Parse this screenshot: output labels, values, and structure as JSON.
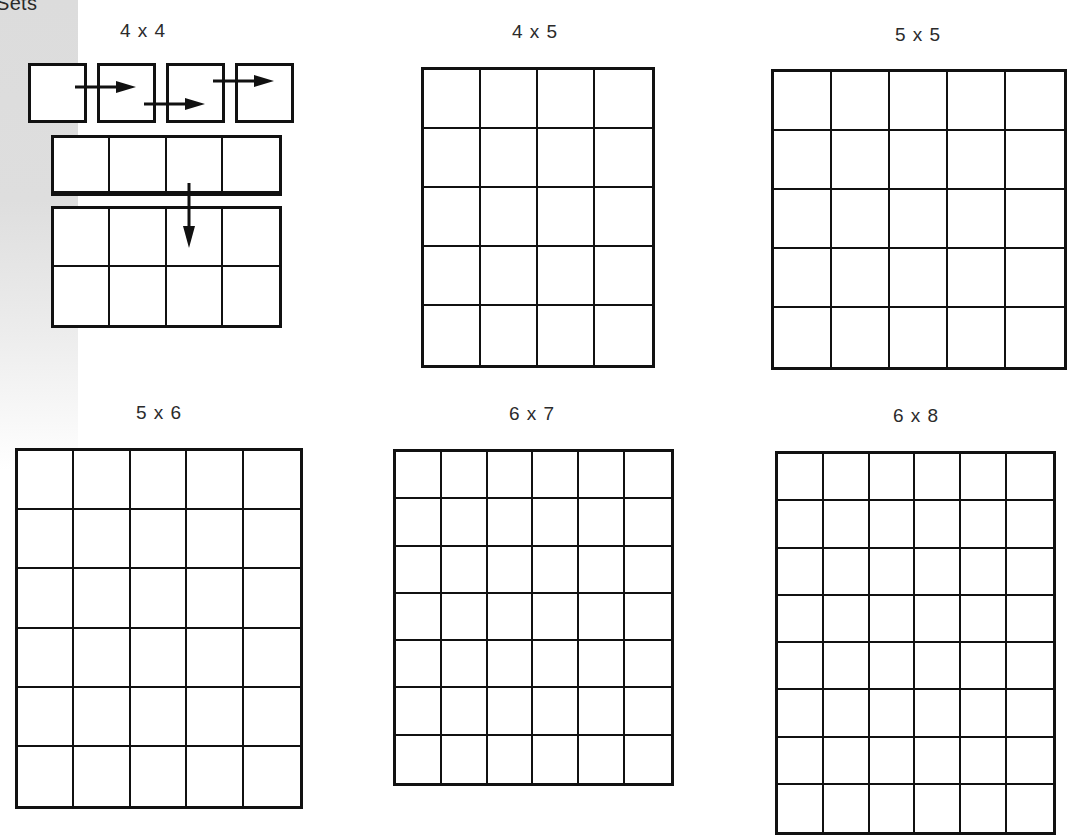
{
  "page": {
    "section_title": "Sets",
    "sidebar_color": "#dddddd",
    "line_color": "#111111"
  },
  "figures": [
    {
      "id": "4x4",
      "label": "4 x 4",
      "cols": 4,
      "rows": 4,
      "style": "composite",
      "parts": [
        "four single squares with right arrows",
        "one row of 4",
        "block of 2 rows of 4 with down arrow"
      ]
    },
    {
      "id": "4x5",
      "label": "4 x 5",
      "cols": 4,
      "rows": 5,
      "style": "grid"
    },
    {
      "id": "5x5",
      "label": "5 x 5",
      "cols": 5,
      "rows": 5,
      "style": "grid"
    },
    {
      "id": "5x6",
      "label": "5 x 6",
      "cols": 5,
      "rows": 6,
      "style": "grid"
    },
    {
      "id": "6x7",
      "label": "6 x 7",
      "cols": 6,
      "rows": 7,
      "style": "grid"
    },
    {
      "id": "6x8",
      "label": "6 x 8",
      "cols": 6,
      "rows": 8,
      "style": "grid"
    }
  ]
}
